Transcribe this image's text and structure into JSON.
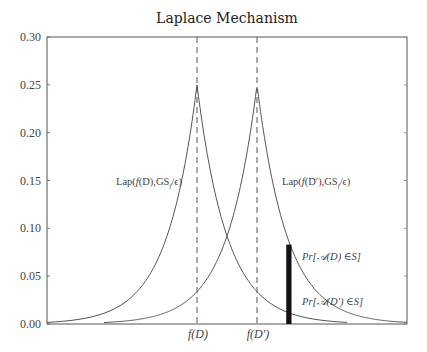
{
  "chart_data": {
    "type": "line",
    "title": "Laplace Mechanism",
    "xlabel": "",
    "ylabel": "",
    "xlim": [
      -10,
      14
    ],
    "ylim": [
      0,
      0.3
    ],
    "yticks": [
      0.0,
      0.05,
      0.1,
      0.15,
      0.2,
      0.25,
      0.3
    ],
    "ytick_labels": [
      "0.00",
      "0.05",
      "0.10",
      "0.15",
      "0.20",
      "0.25",
      "0.30"
    ],
    "xticks": [
      0,
      4
    ],
    "xtick_labels": [
      "f(D)",
      "f(D′)"
    ],
    "grid": false,
    "legend": null,
    "series": [
      {
        "name": "Lap(f(D),GS_f/ε)",
        "kind": "laplace_pdf",
        "mu": 0,
        "b": 2,
        "x_range": [
          -10,
          10
        ],
        "peak": 0.25,
        "color": "#555555"
      },
      {
        "name": "Lap(f(D′),GS_f/ε)",
        "kind": "laplace_pdf",
        "mu": 4,
        "b": 2,
        "x_range": [
          -6.2,
          14
        ],
        "peak": 0.25,
        "color": "#555555"
      }
    ],
    "vlines": [
      {
        "x": 0,
        "style": "dashed",
        "label": "f(D)"
      },
      {
        "x": 4,
        "style": "dashed",
        "label": "f(D′)"
      }
    ],
    "highlight_bar": {
      "x0": 5.95,
      "x1": 6.3,
      "y": 0.083,
      "color": "#111111"
    },
    "annotations": [
      {
        "text": "Lap(f(D),GS_f/ε)",
        "x": -5.7,
        "y": 0.175
      },
      {
        "text": "Lap(f(D′),GS_f/ε)",
        "x": 4.9,
        "y": 0.175
      },
      {
        "text": "Pr[𝒜(D) ∈S]",
        "x": 6.7,
        "y": 0.068
      },
      {
        "text": "Pr[𝒜(D′) ∈S]",
        "x": 6.7,
        "y": 0.024
      }
    ]
  },
  "labels": {
    "title": "Laplace Mechanism",
    "lap1_main": "Lap(",
    "lap1_f": "f",
    "lap1_rest": "(D),GS",
    "lap1_sub": "f",
    "lap1_end": "/ϵ)",
    "lap2_main": "Lap(",
    "lap2_f": "f",
    "lap2_rest": "(D′),GS",
    "lap2_sub": "f",
    "lap2_end": "/ϵ)",
    "pr1": "Pr[𝒜(D) ∈S]",
    "pr2": "Pr[𝒜(D′) ∈S]",
    "x_fD": "f(D)",
    "x_fDp": "f(D′)"
  }
}
